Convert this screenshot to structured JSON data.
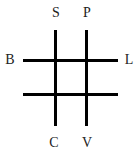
{
  "diagram": {
    "type": "tic-tac-toe-grid",
    "line_color": "#000000",
    "label_color": "#222222",
    "labels": {
      "top_left": "S",
      "top_right": "P",
      "left": "B",
      "right": "L",
      "bottom_left": "C",
      "bottom_right": "V"
    }
  }
}
